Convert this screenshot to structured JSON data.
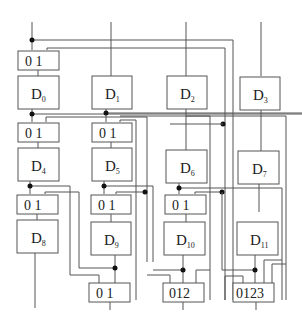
{
  "diagram": {
    "type": "circuit-block-diagram",
    "columns": 4,
    "blocks": [
      {
        "id": "D0",
        "base": "D",
        "sub": "0"
      },
      {
        "id": "D1",
        "base": "D",
        "sub": "1"
      },
      {
        "id": "D2",
        "base": "D",
        "sub": "2"
      },
      {
        "id": "D3",
        "base": "D",
        "sub": "3"
      },
      {
        "id": "D4",
        "base": "D",
        "sub": "4"
      },
      {
        "id": "D5",
        "base": "D",
        "sub": "5"
      },
      {
        "id": "D6",
        "base": "D",
        "sub": "6"
      },
      {
        "id": "D7",
        "base": "D",
        "sub": "7"
      },
      {
        "id": "D8",
        "base": "D",
        "sub": "8"
      },
      {
        "id": "D9",
        "base": "D",
        "sub": "9"
      },
      {
        "id": "D10",
        "base": "D",
        "sub": "10"
      },
      {
        "id": "D11",
        "base": "D",
        "sub": "11"
      }
    ],
    "muxes": [
      {
        "id": "mux-row1-col0",
        "label": "0 1"
      },
      {
        "id": "mux-row2-col0",
        "label": "0 1"
      },
      {
        "id": "mux-row2-col1",
        "label": "0 1"
      },
      {
        "id": "mux-row3-col0",
        "label": "0 1"
      },
      {
        "id": "mux-row3-col1",
        "label": "0 1"
      },
      {
        "id": "mux-row3-col2",
        "label": "0 1"
      },
      {
        "id": "mux-out-1",
        "label": "0 1"
      },
      {
        "id": "mux-out-2",
        "label": "012"
      },
      {
        "id": "mux-out-3",
        "label": "0123"
      }
    ]
  }
}
